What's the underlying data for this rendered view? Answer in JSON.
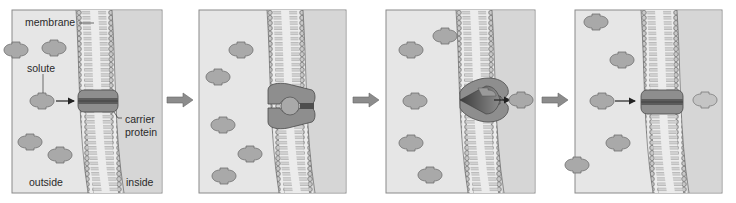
{
  "figure": {
    "panel_count": 4,
    "step_arrows": 3
  },
  "labels": {
    "membrane": "membrane",
    "solute": "solute",
    "carrier_protein_line1": "carrier",
    "carrier_protein_line2": "protein",
    "outside": "outside",
    "inside": "inside"
  },
  "panels": [
    {
      "step": 1,
      "carrier_state": "open-outside",
      "description": "Solute approaches closed carrier protein from outside",
      "outside_solutes": 5,
      "inside_solutes": 0
    },
    {
      "step": 2,
      "carrier_state": "bound",
      "description": "Solute binds carrier protein; carrier changes shape",
      "outside_solutes": 5,
      "inside_solutes": 0
    },
    {
      "step": 3,
      "carrier_state": "open-inside",
      "description": "Carrier opens to inside and releases solute",
      "outside_solutes": 5,
      "inside_solutes": 1
    },
    {
      "step": 4,
      "carrier_state": "reset",
      "description": "Carrier returns to original shape; next solute approaches",
      "outside_solutes": 5,
      "inside_solutes": 1
    }
  ],
  "colors": {
    "outside_bg": "#e6e6e6",
    "inside_bg": "#d6d6d6",
    "panel_border": "#8a8a8a",
    "solute_fill": "#a9a9a9",
    "solute_stroke": "#6e6e6e",
    "carrier_fill": "#8e8e8e",
    "carrier_dark": "#5c5c5c",
    "membrane_head": "#bdbdbd",
    "step_arrow": "#8c8c8c"
  }
}
